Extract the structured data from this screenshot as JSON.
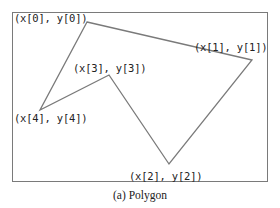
{
  "figure": {
    "caption": "(a) Polygon",
    "stroke_color": "#7a7a7a",
    "text_color": "#222222",
    "vertices": [
      {
        "index": 0,
        "label": "(x[0], y[0])",
        "x": 87,
        "y": 22
      },
      {
        "index": 1,
        "label": "(x[1], y[1])",
        "x": 252,
        "y": 60
      },
      {
        "index": 2,
        "label": "(x[2], y[2])",
        "x": 169,
        "y": 164
      },
      {
        "index": 3,
        "label": "(x[3], y[3])",
        "x": 109,
        "y": 75
      },
      {
        "index": 4,
        "label": "(x[4], y[4])",
        "x": 40,
        "y": 110
      }
    ]
  }
}
